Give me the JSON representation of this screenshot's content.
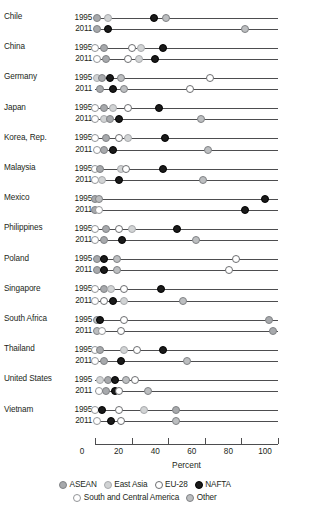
{
  "chart_data": {
    "type": "scatter",
    "title": "",
    "xlabel": "Percent",
    "ylabel": "",
    "xlim": [
      0,
      100
    ],
    "xticks": [
      0,
      20,
      40,
      60,
      80,
      100
    ],
    "grid": false,
    "legend_position": "bottom",
    "series_order": [
      "ASEAN",
      "East Asia",
      "EU-28",
      "NAFTA",
      "South and Central America",
      "Other"
    ],
    "legend": [
      {
        "label": "ASEAN",
        "key": "asean",
        "color": "#a7a9ac"
      },
      {
        "label": "East Asia",
        "key": "eastasia",
        "color": "#d1d3d4"
      },
      {
        "label": "EU-28",
        "key": "eu28",
        "color": "#ffffff"
      },
      {
        "label": "NAFTA",
        "key": "nafta",
        "color": "#1a1a1a"
      },
      {
        "label": "South and Central America",
        "key": "scam",
        "color": "#ffffff"
      },
      {
        "label": "Other",
        "key": "other",
        "color": "#bcbec0"
      }
    ],
    "years": [
      "1995",
      "2011"
    ],
    "countries": [
      {
        "name": "Chile",
        "rows": [
          {
            "year": "1995",
            "line_end": 100,
            "points": [
              {
                "series": "asean",
                "value": 1
              },
              {
                "series": "eastasia",
                "value": 7
              },
              {
                "series": "nafta",
                "value": 32
              },
              {
                "series": "other",
                "value": 39
              }
            ]
          },
          {
            "year": "2011",
            "line_end": 100,
            "points": [
              {
                "series": "asean",
                "value": 1
              },
              {
                "series": "nafta",
                "value": 7
              },
              {
                "series": "other",
                "value": 82
              }
            ]
          }
        ]
      },
      {
        "name": "China",
        "rows": [
          {
            "year": "1995",
            "line_end": 100,
            "points": [
              {
                "series": "scam",
                "value": 0
              },
              {
                "series": "asean",
                "value": 5
              },
              {
                "series": "eu28",
                "value": 20
              },
              {
                "series": "eastasia",
                "value": 25
              },
              {
                "series": "nafta",
                "value": 37
              }
            ]
          },
          {
            "year": "2011",
            "line_end": 100,
            "points": [
              {
                "series": "scam",
                "value": 1
              },
              {
                "series": "asean",
                "value": 6
              },
              {
                "series": "eu28",
                "value": 18
              },
              {
                "series": "eastasia",
                "value": 24
              },
              {
                "series": "nafta",
                "value": 33
              }
            ]
          }
        ]
      },
      {
        "name": "Germany",
        "rows": [
          {
            "year": "1995",
            "line_end": 100,
            "points": [
              {
                "series": "eastasia",
                "value": 1
              },
              {
                "series": "asean",
                "value": 4
              },
              {
                "series": "nafta",
                "value": 8
              },
              {
                "series": "other",
                "value": 14
              },
              {
                "series": "eu28",
                "value": 63
              }
            ]
          },
          {
            "year": "2011",
            "line_end": 100,
            "points": [
              {
                "series": "asean",
                "value": 3
              },
              {
                "series": "nafta",
                "value": 10
              },
              {
                "series": "other",
                "value": 16
              },
              {
                "series": "eu28",
                "value": 52
              }
            ]
          }
        ]
      },
      {
        "name": "Japan",
        "rows": [
          {
            "year": "1995",
            "line_end": 100,
            "points": [
              {
                "series": "scam",
                "value": 0
              },
              {
                "series": "asean",
                "value": 5
              },
              {
                "series": "eastasia",
                "value": 10
              },
              {
                "series": "eu28",
                "value": 18
              },
              {
                "series": "nafta",
                "value": 35
              }
            ]
          },
          {
            "year": "2011",
            "line_end": 100,
            "points": [
              {
                "series": "scam",
                "value": 0
              },
              {
                "series": "eastasia",
                "value": 5
              },
              {
                "series": "asean",
                "value": 8
              },
              {
                "series": "nafta",
                "value": 13
              },
              {
                "series": "other",
                "value": 58
              }
            ]
          }
        ]
      },
      {
        "name": "Korea, Rep.",
        "rows": [
          {
            "year": "1995",
            "line_end": 100,
            "points": [
              {
                "series": "scam",
                "value": 0
              },
              {
                "series": "asean",
                "value": 6
              },
              {
                "series": "eu28",
                "value": 13
              },
              {
                "series": "eastasia",
                "value": 18
              },
              {
                "series": "nafta",
                "value": 38
              }
            ]
          },
          {
            "year": "2011",
            "line_end": 100,
            "points": [
              {
                "series": "scam",
                "value": 1
              },
              {
                "series": "asean",
                "value": 5
              },
              {
                "series": "nafta",
                "value": 10
              },
              {
                "series": "other",
                "value": 62
              }
            ]
          }
        ]
      },
      {
        "name": "Malaysia",
        "rows": [
          {
            "year": "1995",
            "line_end": 100,
            "points": [
              {
                "series": "scam",
                "value": 0
              },
              {
                "series": "asean",
                "value": 3
              },
              {
                "series": "eastasia",
                "value": 14
              },
              {
                "series": "eu28",
                "value": 17
              },
              {
                "series": "nafta",
                "value": 37
              }
            ]
          },
          {
            "year": "2011",
            "line_end": 100,
            "points": [
              {
                "series": "scam",
                "value": 0
              },
              {
                "series": "eastasia",
                "value": 4
              },
              {
                "series": "nafta",
                "value": 13
              },
              {
                "series": "other",
                "value": 59
              }
            ]
          }
        ]
      },
      {
        "name": "Mexico",
        "rows": [
          {
            "year": "1995",
            "line_end": 100,
            "points": [
              {
                "series": "asean",
                "value": 0
              },
              {
                "series": "other",
                "value": 2
              },
              {
                "series": "nafta",
                "value": 93
              }
            ]
          },
          {
            "year": "2011",
            "line_end": 100,
            "points": [
              {
                "series": "asean",
                "value": 0
              },
              {
                "series": "scam",
                "value": 2
              },
              {
                "series": "nafta",
                "value": 82
              }
            ]
          }
        ]
      },
      {
        "name": "Philippines",
        "rows": [
          {
            "year": "1995",
            "line_end": 100,
            "points": [
              {
                "series": "scam",
                "value": 0
              },
              {
                "series": "asean",
                "value": 6
              },
              {
                "series": "eu28",
                "value": 13
              },
              {
                "series": "eastasia",
                "value": 20
              },
              {
                "series": "nafta",
                "value": 45
              }
            ]
          },
          {
            "year": "2011",
            "line_end": 100,
            "points": [
              {
                "series": "scam",
                "value": 0
              },
              {
                "series": "asean",
                "value": 5
              },
              {
                "series": "nafta",
                "value": 15
              },
              {
                "series": "other",
                "value": 55
              }
            ]
          }
        ]
      },
      {
        "name": "Poland",
        "rows": [
          {
            "year": "1995",
            "line_end": 100,
            "points": [
              {
                "series": "asean",
                "value": 1
              },
              {
                "series": "nafta",
                "value": 5
              },
              {
                "series": "other",
                "value": 12
              },
              {
                "series": "eu28",
                "value": 77
              }
            ]
          },
          {
            "year": "2011",
            "line_end": 100,
            "points": [
              {
                "series": "asean",
                "value": 1
              },
              {
                "series": "nafta",
                "value": 5
              },
              {
                "series": "other",
                "value": 12
              },
              {
                "series": "eu28",
                "value": 73
              }
            ]
          }
        ]
      },
      {
        "name": "Singapore",
        "rows": [
          {
            "year": "1995",
            "line_end": 100,
            "points": [
              {
                "series": "scam",
                "value": 0
              },
              {
                "series": "asean",
                "value": 5
              },
              {
                "series": "eastasia",
                "value": 9
              },
              {
                "series": "eu28",
                "value": 16
              },
              {
                "series": "nafta",
                "value": 36
              }
            ]
          },
          {
            "year": "2011",
            "line_end": 100,
            "points": [
              {
                "series": "scam",
                "value": 0
              },
              {
                "series": "eu28",
                "value": 5
              },
              {
                "series": "nafta",
                "value": 10
              },
              {
                "series": "eastasia",
                "value": 16
              },
              {
                "series": "other",
                "value": 48
              }
            ]
          }
        ]
      },
      {
        "name": "South Africa",
        "rows": [
          {
            "year": "1995",
            "line_end": 100,
            "points": [
              {
                "series": "other",
                "value": 1
              },
              {
                "series": "nafta",
                "value": 3
              },
              {
                "series": "eu28",
                "value": 16
              },
              {
                "series": "asean",
                "value": 95
              }
            ]
          },
          {
            "year": "2011",
            "line_end": 100,
            "points": [
              {
                "series": "other",
                "value": 1
              },
              {
                "series": "scam",
                "value": 4
              },
              {
                "series": "eu28",
                "value": 14
              },
              {
                "series": "asean",
                "value": 97
              }
            ]
          }
        ]
      },
      {
        "name": "Thailand",
        "rows": [
          {
            "year": "1995",
            "line_end": 100,
            "points": [
              {
                "series": "scam",
                "value": 0
              },
              {
                "series": "asean",
                "value": 3
              },
              {
                "series": "eastasia",
                "value": 16
              },
              {
                "series": "eu28",
                "value": 23
              },
              {
                "series": "nafta",
                "value": 37
              }
            ]
          },
          {
            "year": "2011",
            "line_end": 100,
            "points": [
              {
                "series": "scam",
                "value": 0
              },
              {
                "series": "asean",
                "value": 5
              },
              {
                "series": "nafta",
                "value": 14
              },
              {
                "series": "other",
                "value": 50
              }
            ]
          }
        ]
      },
      {
        "name": "United States",
        "rows": [
          {
            "year": "1995",
            "line_end": 100,
            "points": [
              {
                "series": "eastasia",
                "value": 3
              },
              {
                "series": "asean",
                "value": 7
              },
              {
                "series": "nafta",
                "value": 11
              },
              {
                "series": "other",
                "value": 17
              },
              {
                "series": "eu28",
                "value": 22
              }
            ]
          },
          {
            "year": "2011",
            "line_end": 100,
            "points": [
              {
                "series": "scam",
                "value": 2
              },
              {
                "series": "asean",
                "value": 6
              },
              {
                "series": "nafta",
                "value": 11
              },
              {
                "series": "eu28",
                "value": 13
              },
              {
                "series": "other",
                "value": 29
              }
            ]
          }
        ]
      },
      {
        "name": "Vietnam",
        "rows": [
          {
            "year": "1995",
            "line_end": 100,
            "points": [
              {
                "series": "scam",
                "value": 0
              },
              {
                "series": "nafta",
                "value": 4
              },
              {
                "series": "eu28",
                "value": 13
              },
              {
                "series": "eastasia",
                "value": 27
              },
              {
                "series": "asean",
                "value": 44
              }
            ]
          },
          {
            "year": "2011",
            "line_end": 100,
            "points": [
              {
                "series": "scam",
                "value": 1
              },
              {
                "series": "nafta",
                "value": 9
              },
              {
                "series": "eu28",
                "value": 14
              },
              {
                "series": "other",
                "value": 44
              }
            ]
          }
        ]
      }
    ]
  }
}
